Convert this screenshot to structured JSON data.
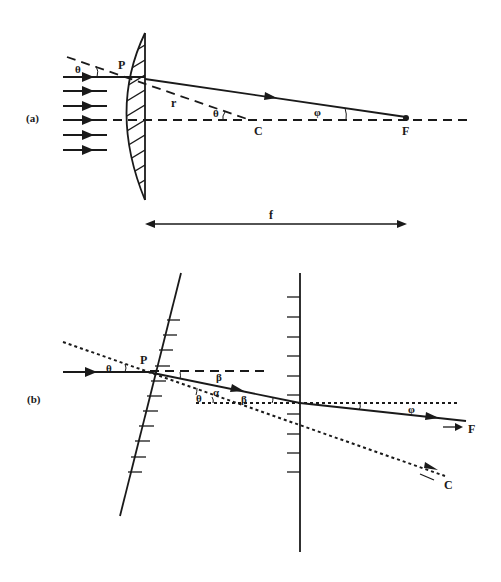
{
  "figure": {
    "panel_a": {
      "label": "(a)",
      "points": {
        "P": "P",
        "C": "C",
        "F": "F"
      },
      "radius_label": "r",
      "angle_incidence": "θ",
      "angle_center": "θ",
      "angle_focus": "φ",
      "focal_length_label": "f",
      "incoming_rays": 6
    },
    "panel_b": {
      "label": "(b)",
      "point_P": "P",
      "angle_theta_1": "θ",
      "angle_theta_2": "θ",
      "angle_alpha": "α",
      "angle_beta_1": "β",
      "angle_beta_2": "β",
      "angle_phi": "φ",
      "direction_F": "F",
      "direction_C": "C"
    },
    "colors": {
      "ink": "#1a1a1a",
      "background": "#ffffff"
    }
  }
}
